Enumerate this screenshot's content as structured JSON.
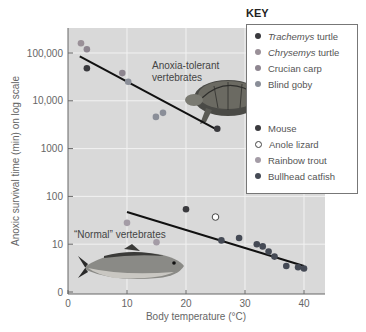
{
  "chart_data": {
    "type": "scatter",
    "title": "",
    "xlabel": "Body temperature (°C)",
    "ylabel": "Anoxic survival time (min) on log scale",
    "xlim": [
      0,
      43
    ],
    "ylim": [
      1,
      200000
    ],
    "yscale": "log",
    "grid": true,
    "x_ticks": [
      "0",
      "10",
      "20",
      "30",
      "40"
    ],
    "y_ticks": [
      "0",
      "10",
      "100",
      "1000",
      "10,000",
      "100,000"
    ],
    "legend_title": "KEY",
    "legend_position": "upper right",
    "groups": [
      {
        "name": "Anoxia-tolerant vertebrates",
        "trendline": {
          "x": [
            2,
            25
          ],
          "y": [
            85000,
            2600
          ]
        }
      },
      {
        "name": "“Normal” vertebrates",
        "trendline": {
          "x": [
            10,
            40
          ],
          "y": [
            47,
            3.5
          ]
        }
      }
    ],
    "series": [
      {
        "name": "Trachemys turtle",
        "italic_part": "Trachemys",
        "rest": " turtle",
        "color": "#3a3a3e",
        "hollow": false,
        "x": [
          3.2,
          25.3
        ],
        "y": [
          48000,
          2600
        ]
      },
      {
        "name": "Chrysemys turtle",
        "italic_part": "Chrysemys",
        "rest": " turtle",
        "color": "#9a9098",
        "hollow": false,
        "x": [
          2.2
        ],
        "y": [
          160000
        ]
      },
      {
        "name": "Crucian carp",
        "italic_part": "",
        "rest": "Crucian carp",
        "color": "#8e8690",
        "hollow": false,
        "x": [
          3.2,
          9.2
        ],
        "y": [
          120000,
          38000
        ]
      },
      {
        "name": "Blind goby",
        "italic_part": "",
        "rest": "Blind goby",
        "color": "#8a8e98",
        "hollow": false,
        "x": [
          10.2,
          14.9,
          16.1
        ],
        "y": [
          25000,
          4600,
          5600
        ]
      },
      {
        "name": "Mouse",
        "italic_part": "",
        "rest": "Mouse",
        "color": "#3a3a3e",
        "hollow": false,
        "x": [
          20
        ],
        "y": [
          54
        ]
      },
      {
        "name": "Anole lizard",
        "italic_part": "",
        "rest": "Anole lizard",
        "color": "#ffffff",
        "hollow": true,
        "x": [
          25
        ],
        "y": [
          37
        ]
      },
      {
        "name": "Rainbow trout",
        "italic_part": "",
        "rest": "Rainbow trout",
        "color": "#a49ca6",
        "hollow": false,
        "x": [
          10,
          15
        ],
        "y": [
          28,
          11
        ]
      },
      {
        "name": "Bullhead catfish",
        "italic_part": "",
        "rest": "Bullhead catfish",
        "color": "#454a55",
        "hollow": false,
        "x": [
          26,
          29,
          32,
          33,
          34,
          35,
          37,
          39,
          40
        ],
        "y": [
          12,
          13.5,
          10,
          9,
          7,
          5.5,
          3.5,
          3.3,
          3.1
        ]
      }
    ],
    "annotations": [
      "Anoxia-tolerant vertebrates",
      "“Normal” vertebrates"
    ]
  },
  "labels": {
    "annot_tolerant_1": "Anoxia-tolerant",
    "annot_tolerant_2": "vertebrates",
    "annot_normal": "“Normal” vertebrates",
    "key_title": "KEY"
  }
}
